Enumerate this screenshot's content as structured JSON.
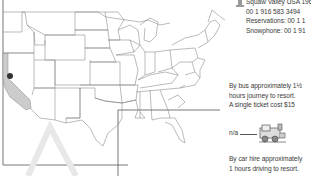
{
  "contact": {
    "lines": [
      "Squaw Valley USA 1960",
      "00 1 916 583 3494",
      "Reservations: 00 1 1",
      "Snowphone: 00 1 91"
    ]
  },
  "bus": {
    "lines": [
      "By bus approximately 1½",
      "hours journey to resort.",
      "A single ticket cost $15"
    ]
  },
  "train": {
    "label": "n/a",
    "icon": "train-icon"
  },
  "car": {
    "lines": [
      "By car hire approximately",
      "1 hours driving to resort."
    ]
  },
  "map": {
    "highlight_state": "California",
    "marker": "Squaw Valley",
    "highlight_color": "#cccccc",
    "marker_color": "#333333"
  }
}
